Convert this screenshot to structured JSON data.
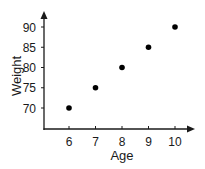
{
  "chart_data": {
    "type": "scatter",
    "title": "",
    "xlabel": "Age",
    "ylabel": "Weight",
    "x": [
      6,
      7,
      8,
      9,
      10
    ],
    "y": [
      70,
      75,
      80,
      85,
      90
    ],
    "xticks": [
      "6",
      "7",
      "8",
      "9",
      "10"
    ],
    "yticks": [
      "70",
      "75",
      "80",
      "85",
      "90"
    ],
    "xlim": [
      5,
      11
    ],
    "ylim": [
      65,
      95
    ],
    "grid": false,
    "legend": null,
    "marker_color": "#000000",
    "axis_color": "#1a1a1a"
  }
}
